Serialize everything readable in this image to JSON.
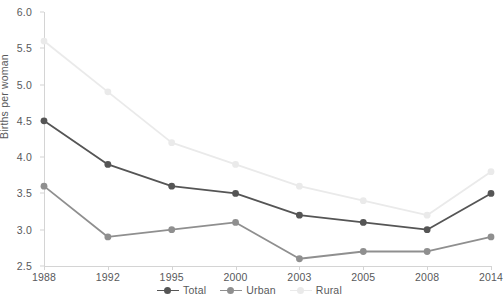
{
  "chart_data": {
    "type": "line",
    "title": "",
    "xlabel": "",
    "ylabel": "Births per woman",
    "categories": [
      "1988",
      "1992",
      "1995",
      "2000",
      "2003",
      "2005",
      "2008",
      "2014"
    ],
    "ylim": [
      2.5,
      6.0
    ],
    "ytick_step": 0.5,
    "yticks": [
      "2.5",
      "3.0",
      "3.5",
      "4.0",
      "4.5",
      "5.0",
      "5.5",
      "6.0"
    ],
    "grid": false,
    "legend_position": "bottom-center",
    "series": [
      {
        "name": "Total",
        "color": "#555555",
        "values": [
          4.5,
          3.9,
          3.6,
          3.5,
          3.2,
          3.1,
          3.0,
          3.5
        ]
      },
      {
        "name": "Urban",
        "color": "#8f8f8f",
        "values": [
          3.6,
          2.9,
          3.0,
          3.1,
          2.6,
          2.7,
          2.7,
          2.9
        ]
      },
      {
        "name": "Rural",
        "color": "#eaeaea",
        "values": [
          5.6,
          4.9,
          4.2,
          3.9,
          3.6,
          3.4,
          3.2,
          3.8
        ]
      }
    ]
  },
  "axis": {
    "y_title": "Births per woman"
  },
  "legend": {
    "items": [
      {
        "label": "Total",
        "color": "#555555"
      },
      {
        "label": "Urban",
        "color": "#8f8f8f"
      },
      {
        "label": "Rural",
        "color": "#eaeaea"
      }
    ]
  },
  "colors": {
    "total": "#555555",
    "urban": "#8f8f8f",
    "rural": "#eaeaea",
    "axis": "#d4d4d4",
    "text": "#58595b",
    "background": "#ffffff"
  }
}
